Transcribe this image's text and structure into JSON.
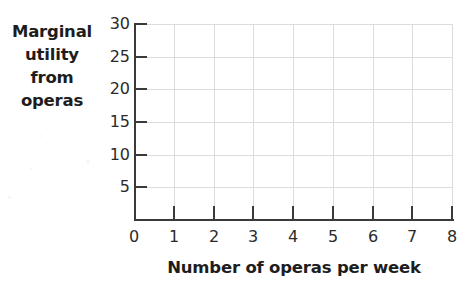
{
  "chart_data": {
    "type": "line",
    "title": "",
    "subtitle": "",
    "xlabel": "Number of operas per week",
    "ylabel": "Marginal utility from operas",
    "ylabel_lines": [
      "Marginal",
      "utility",
      "from",
      "operas"
    ],
    "xlim": [
      0,
      8
    ],
    "ylim": [
      0,
      30
    ],
    "xticks": [
      0,
      1,
      2,
      3,
      4,
      5,
      6,
      7,
      8
    ],
    "xticklabels": [
      "0",
      "1",
      "2",
      "3",
      "4",
      "5",
      "6",
      "7",
      "8"
    ],
    "yticks": [
      5,
      10,
      15,
      20,
      25,
      30
    ],
    "yticklabels": [
      "5",
      "10",
      "15",
      "20",
      "25",
      "30"
    ],
    "y_origin_label": "0",
    "grid": true,
    "grid_color": "#dcdcdc",
    "axis_color": "#3a3a3a",
    "background_color": "#ffffff",
    "text_color": "#1d1d1d",
    "legend": null,
    "series": [],
    "values": [],
    "categories": [],
    "annotations": [],
    "note": "Blank grid — no data series are plotted in the figure"
  }
}
